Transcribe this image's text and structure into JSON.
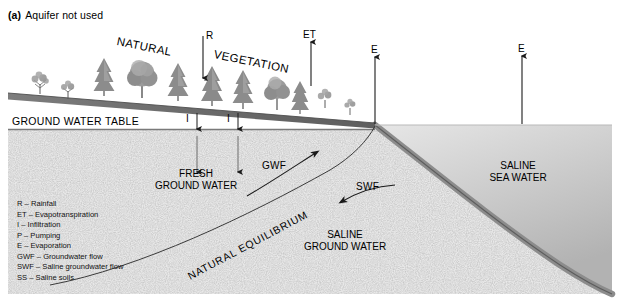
{
  "figure": {
    "panel_tag": "(a)",
    "panel_title": "Aquifer not used"
  },
  "surface_labels": {
    "natural": "NATURAL",
    "vegetation": "VEGETATION",
    "ground_water_table": "GROUND WATER TABLE"
  },
  "flux_arrows": [
    {
      "id": "rainfall",
      "symbol": "R",
      "direction": "down"
    },
    {
      "id": "evapotranspiration",
      "symbol": "ET",
      "direction": "up"
    },
    {
      "id": "infiltration-1",
      "symbol": "I",
      "direction": "down"
    },
    {
      "id": "infiltration-2",
      "symbol": "I",
      "direction": "down"
    },
    {
      "id": "evaporation-coast",
      "symbol": "E",
      "direction": "up"
    },
    {
      "id": "evaporation-sea",
      "symbol": "E",
      "direction": "up"
    }
  ],
  "zone_labels": {
    "fresh_ground_water": "FRESH\nGROUND WATER",
    "fresh_line_1": "FRESH",
    "fresh_line_2": "GROUND WATER",
    "saline_ground_water_1": "SALINE",
    "saline_ground_water_2": "GROUND WATER",
    "saline_sea_water_1": "SALINE",
    "saline_sea_water_2": "SEA WATER",
    "natural_equilibrium": "NATURAL EQUILIBRIUM"
  },
  "flow_labels": {
    "gwf": "GWF",
    "swf": "SWF"
  },
  "legend": {
    "items": [
      "R – Rainfall",
      "ET – Evapotranspiration",
      "I – Infiltration",
      "P – Pumping",
      "E – Evaporation",
      "GWF – Groundwater flow",
      "SWF – Saline groundwater flow",
      "SS – Saline soils"
    ]
  },
  "colors": {
    "background": "#ffffff",
    "ground_band": "#6f6f6f",
    "aquifer_stipple": "#eeeeee",
    "sea_water_light": "#d2d2d2",
    "sea_water_mid": "#bdbdbd",
    "seabed_band": "#8a8a8a",
    "line": "#1a1a1a",
    "text": "#000000"
  }
}
